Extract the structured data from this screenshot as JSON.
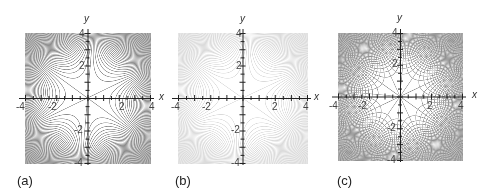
{
  "chart_data": [
    {
      "type": "contour",
      "panel_label": "(a)",
      "xlabel": "x",
      "ylabel": "y",
      "xlim": [
        -4,
        4
      ],
      "ylim": [
        -4,
        4
      ],
      "x_ticks": [
        "-4",
        "-2",
        "2",
        "4"
      ],
      "y_ticks": [
        "4",
        "2",
        "-2",
        "-4"
      ],
      "function": "r^3 * sin(3*(theta - 25deg))  (monkey-saddle level curves)",
      "zero_lines_deg": [
        25,
        85,
        145
      ],
      "line_color": "#8c8c8c",
      "levels": 34,
      "grid_overlay": false
    },
    {
      "type": "contour",
      "panel_label": "(b)",
      "xlabel": "x",
      "ylabel": "y",
      "xlim": [
        -4,
        4
      ],
      "ylim": [
        -4,
        4
      ],
      "x_ticks": [
        "-4",
        "-2",
        "2",
        "4"
      ],
      "y_ticks": [
        "4",
        "2",
        "-2",
        "-4"
      ],
      "function": "r^3 * sin(3*(theta - 25deg))  (monkey-saddle level curves, faint)",
      "zero_lines_deg": [
        25,
        85,
        145
      ],
      "line_color": "#dadada",
      "levels": 34,
      "grid_overlay": false
    },
    {
      "type": "contour",
      "panel_label": "(c)",
      "xlabel": "x",
      "ylabel": "y",
      "xlim": [
        -4,
        4
      ],
      "ylim": [
        -4,
        4
      ],
      "x_ticks": [
        "-4",
        "-2",
        "2",
        "4"
      ],
      "y_ticks": [
        "4",
        "2",
        "-2",
        "-4"
      ],
      "function": "r^3 * sin(3*(theta - 25deg)) overlaid with orthogonal family",
      "zero_lines_deg": [
        25,
        85,
        145
      ],
      "line_color": "#8f8f8f",
      "levels": 34,
      "grid_overlay": true
    }
  ],
  "panels": [
    {
      "left": 8,
      "plot": {
        "x0": 25,
        "x1": 150,
        "y0": 33,
        "y1": 163
      },
      "caption": "(a)"
    },
    {
      "left": 165,
      "plot": {
        "x0": 178,
        "x1": 307,
        "y0": 33,
        "y1": 163
      },
      "caption": "(b)"
    },
    {
      "left": 325,
      "plot": {
        "x0": 338,
        "x1": 462,
        "y0": 33,
        "y1": 160
      },
      "caption": "(c)"
    }
  ]
}
